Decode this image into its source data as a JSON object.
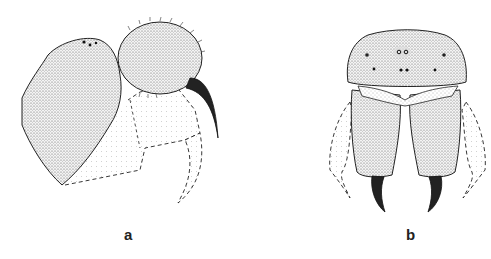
{
  "figure": {
    "panels": [
      {
        "id": "a",
        "label": "a",
        "view": "lateral view of cephalic region with chelicera and fang"
      },
      {
        "id": "b",
        "label": "b",
        "view": "frontal view of cephalic region with chelicerae and fangs"
      }
    ]
  },
  "colors": {
    "ink": "#1a1a1a",
    "stipple": "#555555",
    "background": "#ffffff"
  }
}
